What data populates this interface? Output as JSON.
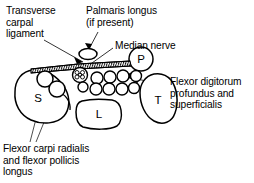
{
  "figure": {
    "background": "#ffffff",
    "ink": "#000000",
    "width": 254,
    "height": 183
  },
  "labels": {
    "transverse_carpal_ligament": "Transverse\ncarpal\nligament",
    "palmaris_longus": "Palmaris longus\n(if present)",
    "median_nerve": "Median nerve",
    "flexor_digitorum": "Flexor digitorum\nprofundus and\nsuperficialis",
    "flexor_carpi_radialis": "Flexor carpi radialis\nand flexor pollicis\nlongus"
  },
  "bones": {
    "scaphoid": "S",
    "lunate": "L",
    "triquetrum": "T",
    "pisiform": "P"
  },
  "structures": {
    "median_nerve_fascicles": 7,
    "flexor_tendons_top_row": 4,
    "flexor_tendons_bottom_row": 4,
    "flexor_carpi_radialis_circles": 2,
    "palmaris_longus_present": "if present"
  }
}
